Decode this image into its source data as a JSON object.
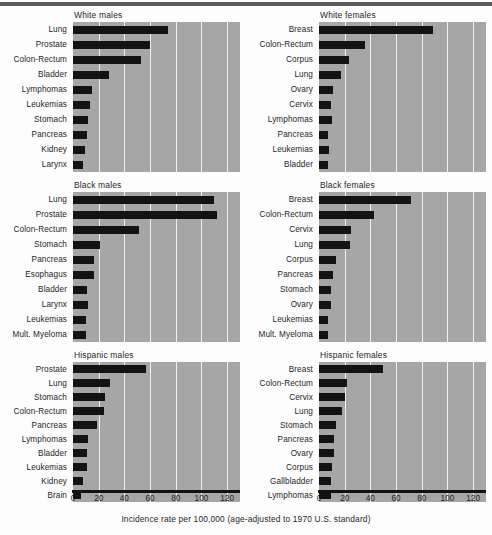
{
  "caption": "Incidence rate per 100,000 (age-adjusted to 1970 U.S. standard)",
  "chart_data": {
    "type": "bar",
    "title": "",
    "xlabel": "Incidence rate per 100,000 (age-adjusted to 1970 U.S. standard)",
    "ylabel": "",
    "xlim": [
      0,
      130
    ],
    "ticks": [
      0,
      20,
      40,
      60,
      80,
      100,
      120
    ],
    "grid": true,
    "orientation": "horizontal",
    "legend": "none",
    "panel_layout": "3 rows x 2 columns",
    "panels": [
      {
        "title": "White males",
        "categories": [
          "Lung",
          "Prostate",
          "Colon-Rectum",
          "Bladder",
          "Lymphomas",
          "Leukemias",
          "Stomach",
          "Pancreas",
          "Kidney",
          "Larynx"
        ],
        "values": [
          74,
          60,
          53,
          28,
          15,
          13,
          12,
          11,
          9,
          8
        ]
      },
      {
        "title": "White females",
        "categories": [
          "Breast",
          "Colon-Rectum",
          "Corpus",
          "Lung",
          "Ovary",
          "Cervix",
          "Lymphomas",
          "Pancreas",
          "Leukemias",
          "Bladder"
        ],
        "values": [
          89,
          36,
          23,
          17,
          11,
          9,
          10,
          7,
          8,
          7
        ]
      },
      {
        "title": "Black males",
        "categories": [
          "Lung",
          "Prostate",
          "Colon-Rectum",
          "Stomach",
          "Pancreas",
          "Esophagus",
          "Bladder",
          "Larynx",
          "Leukemias",
          "Mult. Myeloma"
        ],
        "values": [
          110,
          112,
          51,
          21,
          16,
          16,
          11,
          12,
          10,
          10
        ]
      },
      {
        "title": "Black females",
        "categories": [
          "Breast",
          "Colon-Rectum",
          "Cervix",
          "Lung",
          "Corpus",
          "Pancreas",
          "Stomach",
          "Ovary",
          "Leukemias",
          "Mult. Myeloma"
        ],
        "values": [
          72,
          43,
          25,
          24,
          13,
          11,
          9,
          9,
          7,
          7
        ]
      },
      {
        "title": "Hispanic males",
        "categories": [
          "Prostate",
          "Lung",
          "Stomach",
          "Colon-Rectum",
          "Pancreas",
          "Lymphomas",
          "Bladder",
          "Leukemias",
          "Kidney",
          "Brain"
        ],
        "values": [
          57,
          29,
          25,
          24,
          19,
          12,
          11,
          11,
          8,
          6
        ]
      },
      {
        "title": "Hispanic females",
        "categories": [
          "Breast",
          "Colon-Rectum",
          "Cervix",
          "Lung",
          "Stomach",
          "Pancreas",
          "Ovary",
          "Corpus",
          "Gallbladder",
          "Lymphomas"
        ],
        "values": [
          50,
          22,
          20,
          18,
          13,
          12,
          12,
          10,
          9,
          9
        ]
      }
    ]
  },
  "colors": {
    "bar": "#131313",
    "panel_background": "#a6a6a6",
    "gridline": "#f2f2f2",
    "axis": "#111111",
    "text": "#1d1d1d",
    "page_background": "#fdfdfd"
  }
}
